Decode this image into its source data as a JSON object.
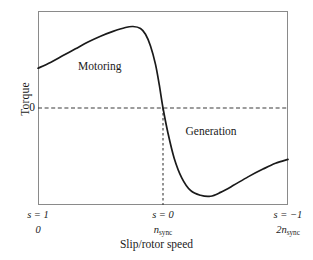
{
  "chart_data": {
    "type": "line",
    "title": "",
    "xlabel": "Slip/rotor speed",
    "ylabel": "Torque",
    "grid": false,
    "legend": null,
    "xlim": [
      0,
      2
    ],
    "ylim": [
      -1,
      1
    ],
    "axis_ticks": {
      "y": [
        {
          "value": 0,
          "label": "0"
        }
      ],
      "x": [
        {
          "value": 0,
          "slip_label": "s = 1",
          "speed_label": "0",
          "speed_label_base": "0",
          "speed_label_sub": ""
        },
        {
          "value": 1,
          "slip_label": "s = 0",
          "speed_label": "nsync",
          "speed_label_base": "n",
          "speed_label_sub": "sync"
        },
        {
          "value": 2,
          "slip_label": "s = −1",
          "speed_label": "2nsync",
          "speed_label_base": "2n",
          "speed_label_sub": "sync"
        }
      ]
    },
    "annotations": [
      {
        "text": "Motoring",
        "x": 0.32,
        "y": 0.42
      },
      {
        "text": "Generation",
        "x": 1.18,
        "y": -0.25
      }
    ],
    "reference_lines": [
      {
        "orientation": "horizontal",
        "value": 0,
        "style": "dashed",
        "label": "0"
      },
      {
        "orientation": "vertical",
        "value": 1,
        "style": "dashed",
        "label": "nsync"
      }
    ],
    "series": [
      {
        "name": "Torque-speed characteristic",
        "color": "#1a1a1a",
        "points": [
          {
            "x": 0.0,
            "y": 0.41
          },
          {
            "x": 0.1,
            "y": 0.47
          },
          {
            "x": 0.2,
            "y": 0.54
          },
          {
            "x": 0.3,
            "y": 0.61
          },
          {
            "x": 0.4,
            "y": 0.68
          },
          {
            "x": 0.5,
            "y": 0.74
          },
          {
            "x": 0.6,
            "y": 0.79
          },
          {
            "x": 0.7,
            "y": 0.83
          },
          {
            "x": 0.76,
            "y": 0.84
          },
          {
            "x": 0.82,
            "y": 0.82
          },
          {
            "x": 0.86,
            "y": 0.76
          },
          {
            "x": 0.9,
            "y": 0.64
          },
          {
            "x": 0.94,
            "y": 0.45
          },
          {
            "x": 0.97,
            "y": 0.24
          },
          {
            "x": 1.0,
            "y": 0.0
          },
          {
            "x": 1.04,
            "y": -0.26
          },
          {
            "x": 1.09,
            "y": -0.52
          },
          {
            "x": 1.15,
            "y": -0.72
          },
          {
            "x": 1.22,
            "y": -0.85
          },
          {
            "x": 1.3,
            "y": -0.9
          },
          {
            "x": 1.38,
            "y": -0.91
          },
          {
            "x": 1.46,
            "y": -0.87
          },
          {
            "x": 1.56,
            "y": -0.8
          },
          {
            "x": 1.68,
            "y": -0.71
          },
          {
            "x": 1.8,
            "y": -0.63
          },
          {
            "x": 1.9,
            "y": -0.57
          },
          {
            "x": 2.0,
            "y": -0.53
          }
        ]
      }
    ]
  },
  "colors": {
    "curve": "#1a1a1a",
    "frame": "#8a8a8a",
    "dashed": "#3a3a3a",
    "background": "#ffffff"
  }
}
